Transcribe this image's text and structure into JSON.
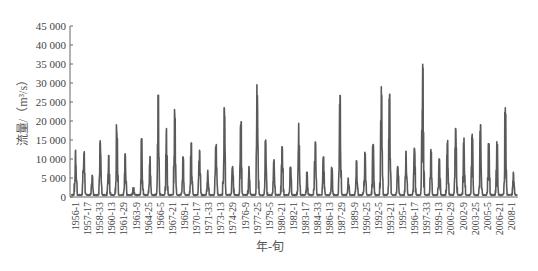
{
  "chart_data": {
    "type": "line",
    "title": "",
    "xlabel": "年-旬",
    "ylabel": "流量/（m³/s）",
    "ylim": [
      0,
      45000
    ],
    "yticks": [
      0,
      5000,
      10000,
      15000,
      20000,
      25000,
      30000,
      35000,
      40000,
      45000
    ],
    "ytick_labels": [
      "0",
      "5 000",
      "10 000",
      "15 000",
      "20 000",
      "25 000",
      "30 000",
      "35 000",
      "40 000",
      "45 000"
    ],
    "grid": false,
    "legend": null,
    "x_tick_labels": [
      "1956-1",
      "1957-17",
      "1958-33",
      "1960-13",
      "1961-29",
      "1963-9",
      "1964-25",
      "1966-5",
      "1967-21",
      "1969-1",
      "1970-17",
      "1971-33",
      "1973-13",
      "1974-29",
      "1976-9",
      "1977-25",
      "1979-5",
      "1980-21",
      "1982-1",
      "1983-17",
      "1984-33",
      "1986-13",
      "1987-29",
      "1989-9",
      "1990-25",
      "1992-5",
      "1993-21",
      "1995-1",
      "1996-17",
      "1997-33",
      "1999-13",
      "2000-29",
      "2002-9",
      "2003-25",
      "2005-5",
      "2006-21",
      "2008-1"
    ],
    "series": [
      {
        "name": "旬流量",
        "color": "#5a5a5a",
        "years": [
          1956,
          1957,
          1958,
          1959,
          1960,
          1961,
          1962,
          1963,
          1964,
          1965,
          1966,
          1967,
          1968,
          1969,
          1970,
          1971,
          1972,
          1973,
          1974,
          1975,
          1976,
          1977,
          1978,
          1979,
          1980,
          1981,
          1982,
          1983,
          1984,
          1985,
          1986,
          1987,
          1988,
          1989,
          1990,
          1991,
          1992,
          1993,
          1994,
          1995,
          1996,
          1997,
          1998,
          1999,
          2000,
          2001,
          2002,
          2003,
          2004,
          2005,
          2006,
          2007,
          2008,
          2009
        ],
        "annual_peaks": [
          12300,
          12400,
          5800,
          14800,
          10900,
          19000,
          11800,
          2500,
          15300,
          11000,
          26800,
          18000,
          23000,
          10500,
          14200,
          12300,
          7000,
          13800,
          23500,
          8000,
          19800,
          8000,
          29500,
          15000,
          9800,
          13200,
          7800,
          20000,
          6500,
          15000,
          10500,
          7800,
          26700,
          5000,
          9500,
          11800,
          13800,
          29000,
          27000,
          8000,
          12000,
          12800,
          37000,
          12500,
          10000,
          15800,
          18000,
          15500,
          16500,
          19000,
          14000,
          14500,
          23500,
          6500
        ],
        "baseflow_min": 500
      }
    ]
  }
}
